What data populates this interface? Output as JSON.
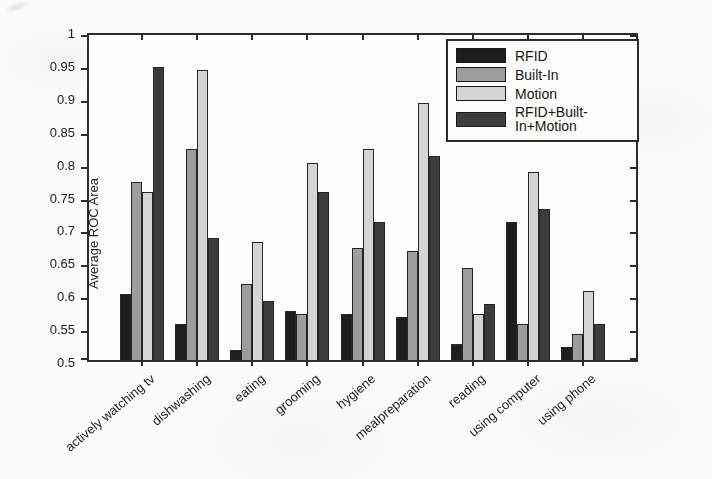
{
  "chart_data": {
    "type": "bar",
    "title": "",
    "xlabel": "",
    "ylabel": "Average ROC Area",
    "ylim": [
      0.5,
      1
    ],
    "ytick_step": 0.05,
    "ytick_labels": [
      "1",
      "0.95",
      "0.9",
      "0.85",
      "0.8",
      "0.75",
      "0.7",
      "0.65",
      "0.6",
      "0.55",
      "0.5"
    ],
    "grid": false,
    "legend_position": "inside-top-right",
    "categories": [
      "actively watching tv",
      "dishwashing",
      "eating",
      "grooming",
      "hygiene",
      "mealpreparation",
      "reading",
      "using computer",
      "using phone"
    ],
    "series": [
      {
        "name": "RFID",
        "color": "#1e1e1e",
        "values": [
          0.6,
          0.555,
          0.515,
          0.575,
          0.57,
          0.565,
          0.525,
          0.71,
          0.52
        ]
      },
      {
        "name": "Built-In",
        "color": "#9d9d9d",
        "values": [
          0.77,
          0.82,
          0.615,
          0.57,
          0.67,
          0.665,
          0.64,
          0.555,
          0.54
        ]
      },
      {
        "name": "Motion",
        "color": "#d4d4d2",
        "values": [
          0.755,
          0.94,
          0.68,
          0.8,
          0.82,
          0.89,
          0.57,
          0.785,
          0.605
        ]
      },
      {
        "name": "RFID+Built-In+Motion",
        "color": "#3c3c3c",
        "values": [
          0.945,
          0.685,
          0.59,
          0.755,
          0.71,
          0.81,
          0.585,
          0.73,
          0.555
        ]
      }
    ]
  },
  "style": {
    "axis_color": "#2c2c2c",
    "plot_background": "#fdfdfb",
    "page_background": "#fbfbf9"
  }
}
